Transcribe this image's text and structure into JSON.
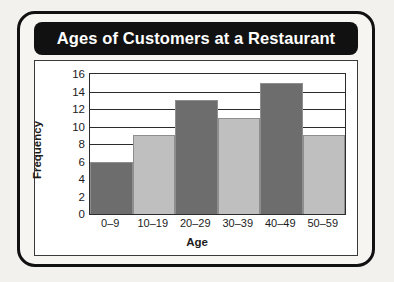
{
  "chart_data": {
    "type": "bar",
    "title": "Ages of Customers at a Restaurant",
    "xlabel": "Age",
    "ylabel": "Frequency",
    "categories": [
      "0–9",
      "10–19",
      "20–29",
      "30–39",
      "40–49",
      "50–59"
    ],
    "values": [
      6,
      9,
      13,
      11,
      15,
      9
    ],
    "ylim": [
      0,
      16
    ],
    "ytick_labels": [
      "0",
      "2",
      "4",
      "6",
      "8",
      "10",
      "12",
      "14",
      "16"
    ],
    "ytick_values": [
      0,
      2,
      4,
      6,
      8,
      10,
      12,
      14,
      16
    ],
    "grid": "horizontal",
    "legend": "none",
    "bar_colors": [
      "#6d6d6d",
      "#bfbfbf",
      "#6d6d6d",
      "#bfbfbf",
      "#6d6d6d",
      "#bfbfbf"
    ],
    "bar_gap": "none"
  },
  "style": {
    "title_text_color": "#ffffff",
    "title_banner_color": "#111111",
    "frame_color": "#111111",
    "page_background": "#f2f1ed",
    "plot_background": "#ffffff",
    "axis_color": "#2b2b2b"
  }
}
